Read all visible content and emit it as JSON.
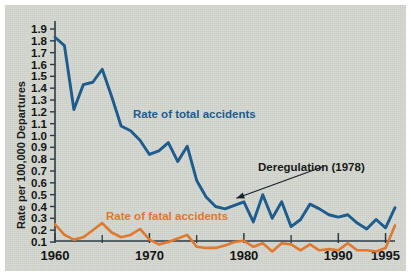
{
  "chart_data": {
    "type": "line",
    "title": "",
    "xlabel": "",
    "ylabel": "Rate per 100,000 Departures",
    "xlim": [
      1960,
      1996
    ],
    "ylim": [
      0.0,
      1.95
    ],
    "grid": false,
    "legend_position": "inline-annotations",
    "x": [
      1960,
      1961,
      1962,
      1963,
      1964,
      1965,
      1966,
      1967,
      1968,
      1969,
      1970,
      1971,
      1972,
      1973,
      1974,
      1975,
      1976,
      1977,
      1978,
      1979,
      1980,
      1981,
      1982,
      1983,
      1984,
      1985,
      1986,
      1987,
      1988,
      1989,
      1990,
      1991,
      1992,
      1993,
      1994,
      1995
    ],
    "xtick_values": [
      1960,
      1970,
      1980,
      1990,
      1995
    ],
    "xtick_labels": [
      "1960",
      "1970",
      "1980",
      "1990",
      "1995"
    ],
    "xminor_tick_values": [
      1965,
      1975,
      1985
    ],
    "ytick_values": [
      0.1,
      0.2,
      0.3,
      0.4,
      0.5,
      0.6,
      0.7,
      0.8,
      0.9,
      1.0,
      1.1,
      1.2,
      1.3,
      1.4,
      1.5,
      1.6,
      1.7,
      1.8,
      1.9
    ],
    "ytick_labels": [
      "0.1",
      "0.2",
      "0.3",
      "0.4",
      "0.5",
      "0.6",
      "0.7",
      "0.8",
      "0.9",
      "1.0",
      "1.1",
      "1.2",
      "1.3",
      "1.4",
      "1.5",
      "1.6",
      "1.7",
      "1.8",
      "1.9"
    ],
    "series": [
      {
        "name": "Rate of total accidents",
        "color": "#1d5c8d",
        "label_text": "Rate of total accidents",
        "values": [
          1.83,
          1.76,
          1.22,
          1.43,
          1.45,
          1.56,
          1.33,
          1.08,
          1.04,
          0.96,
          0.84,
          0.87,
          0.94,
          0.78,
          0.91,
          0.62,
          0.48,
          0.4,
          0.38,
          0.41,
          0.44,
          0.27,
          0.5,
          0.3,
          0.44,
          0.23,
          0.29,
          0.42,
          0.38,
          0.33,
          0.31,
          0.33,
          0.26,
          0.21,
          0.29,
          0.22
        ]
      },
      {
        "name": "Rate of fatal accidents",
        "color": "#e0782e",
        "label_text": "Rate of fatal accidents",
        "values": [
          0.25,
          0.16,
          0.12,
          0.14,
          0.2,
          0.26,
          0.18,
          0.14,
          0.16,
          0.21,
          0.12,
          0.08,
          0.1,
          0.13,
          0.16,
          0.06,
          0.05,
          0.05,
          0.07,
          0.1,
          0.11,
          0.06,
          0.09,
          0.02,
          0.09,
          0.08,
          0.03,
          0.08,
          0.03,
          0.04,
          0.03,
          0.09,
          0.03,
          0.03,
          0.02,
          0.05
        ]
      }
    ],
    "final_point": {
      "x": 1996,
      "blue": 0.39,
      "orange": 0.24
    },
    "annotations": [
      {
        "name": "deregulation",
        "text": "Deregulation (1978)",
        "arrow_from_x": 1988.5,
        "arrow_from_y": 0.74,
        "arrow_to_x": 1979.2,
        "arrow_to_y": 0.47
      }
    ],
    "axis_color": "#2a3a46",
    "background_color": "#d2d6cf"
  }
}
